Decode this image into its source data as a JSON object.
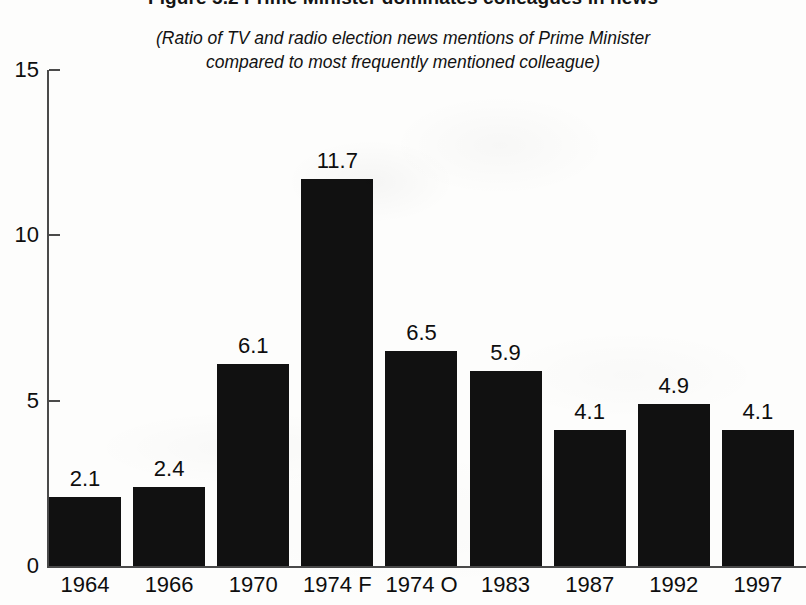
{
  "figure": {
    "title": "Figure 5.2  Prime Minister dominates colleagues in news",
    "subtitle_line_1": "(Ratio of TV and radio election news mentions of Prime Minister",
    "subtitle_line_2": "compared to most frequently mentioned colleague)",
    "bar_color": "#111111",
    "axis_color": "#4a4a4a",
    "background_color": "#fdfdfc"
  },
  "chart_data": {
    "type": "bar",
    "title": "Figure 5.2  Prime Minister dominates colleagues in news",
    "subtitle": "(Ratio of TV and radio election news mentions of Prime Minister compared to most frequently mentioned colleague)",
    "xlabel": "",
    "ylabel": "",
    "ylim": [
      0,
      15
    ],
    "yticks": [
      0,
      5,
      10,
      15
    ],
    "ytick_labels": [
      "0",
      "5",
      "10",
      "15"
    ],
    "grid": false,
    "legend": null,
    "categories": [
      "1964",
      "1966",
      "1970",
      "1974 F",
      "1974 O",
      "1983",
      "1987",
      "1992",
      "1997"
    ],
    "values": [
      2.1,
      2.4,
      6.1,
      11.7,
      6.5,
      5.9,
      4.1,
      4.9,
      4.1
    ],
    "value_labels": [
      "2.1",
      "2.4",
      "6.1",
      "11.7",
      "6.5",
      "5.9",
      "4.1",
      "4.9",
      "4.1"
    ]
  }
}
